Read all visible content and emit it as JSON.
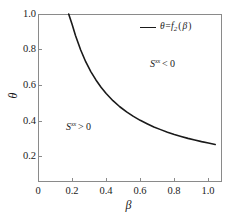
{
  "figure": {
    "background_color": "#ffffff",
    "axis_color": "#8a8a8a",
    "curve_color": "#1a1a1a"
  },
  "axes": {
    "x": {
      "label": "β",
      "ticks": [
        "0",
        "0.2",
        "0.4",
        "0.6",
        "0.8",
        "1.0"
      ],
      "tick_values": [
        0,
        0.2,
        0.4,
        0.6,
        0.8,
        1.0
      ],
      "range": [
        0,
        1.08
      ]
    },
    "y": {
      "label": "θ",
      "ticks": [
        "0.2",
        "0.4",
        "0.6",
        "0.8",
        "1.0"
      ],
      "tick_values": [
        0.2,
        0.4,
        0.6,
        0.8,
        1.0
      ],
      "range": [
        0.06,
        1.0
      ]
    }
  },
  "legend": {
    "entries": [
      {
        "symbol": "θ",
        "equals": "=",
        "func": "f",
        "subscript": "2",
        "open_paren": "(",
        "arg": "β",
        "close_paren": ")",
        "full_label": "θ=f₂(β)",
        "line_color": "#1a1a1a"
      }
    ]
  },
  "annotations": [
    {
      "id": "region-upper",
      "symbol": "S",
      "superscript": "xx",
      "relation": "< 0",
      "full_label": "S^xx < 0",
      "x_data": 0.62,
      "y_data": 0.71
    },
    {
      "id": "region-lower",
      "symbol": "S",
      "superscript": "xx",
      "relation": "> 0",
      "full_label": "S^xx > 0",
      "x_data": 0.2,
      "y_data": 0.36
    }
  ],
  "chart_data": {
    "type": "line",
    "title": "",
    "xlabel": "β",
    "ylabel": "θ",
    "xlim": [
      0,
      1.08
    ],
    "ylim": [
      0.06,
      1.0
    ],
    "grid": false,
    "legend_position": "top-right",
    "series": [
      {
        "name": "θ=f₂(β)",
        "color": "#1a1a1a",
        "linewidth": 1.6,
        "x": [
          0.18,
          0.2,
          0.22,
          0.25,
          0.28,
          0.31,
          0.34,
          0.37,
          0.4,
          0.44,
          0.48,
          0.52,
          0.56,
          0.6,
          0.64,
          0.68,
          0.72,
          0.76,
          0.8,
          0.84,
          0.88,
          0.92,
          0.96,
          1.0,
          1.04
        ],
        "y": [
          1.0,
          0.942,
          0.88,
          0.8,
          0.733,
          0.678,
          0.631,
          0.59,
          0.555,
          0.515,
          0.481,
          0.452,
          0.427,
          0.405,
          0.386,
          0.368,
          0.353,
          0.339,
          0.326,
          0.315,
          0.304,
          0.295,
          0.286,
          0.278,
          0.27
        ]
      }
    ]
  }
}
